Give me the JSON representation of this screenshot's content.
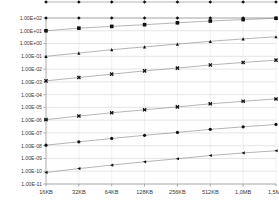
{
  "chart_data": {
    "type": "line",
    "title": "",
    "subtitle": "",
    "xlabel": "",
    "ylabel": "",
    "yscale": "log",
    "xscale": "category",
    "grid": true,
    "legend_position": "none",
    "categories": [
      "16KB",
      "32KB",
      "64KB",
      "128KB",
      "256KB",
      "512KB",
      "1,0MB",
      "1,5MB"
    ],
    "ytick_labels": [
      "1.00E+02",
      "1.00E+01",
      "1.00E+00",
      "1.00E-01",
      "1.00E-02",
      "1.00E-03",
      "1.00E-04",
      "1.00E-05",
      "1.00E-06",
      "1.00E-07",
      "1.00E-08",
      "1.00E-09",
      "1.00E-10",
      "1.00E-11"
    ],
    "ytick_values": [
      100,
      10,
      1,
      0.1,
      0.01,
      0.001,
      0.0001,
      1e-05,
      1e-06,
      1e-07,
      1e-08,
      1e-09,
      1e-10,
      1e-11
    ],
    "ylim": [
      1e-11,
      100.0
    ],
    "series": [
      {
        "name": "series-clipped-top",
        "marker": "diamond",
        "clipped": true,
        "values": [
          600,
          600,
          600,
          600,
          600,
          600,
          600,
          600
        ]
      },
      {
        "name": "series-diamond",
        "marker": "diamond",
        "clipped": false,
        "values": [
          100,
          100,
          100,
          100,
          100,
          100,
          100,
          100
        ]
      },
      {
        "name": "series-square",
        "marker": "square",
        "clipped": false,
        "values": [
          10,
          16,
          22,
          30,
          42,
          58,
          75,
          95
        ]
      },
      {
        "name": "series-triangle",
        "marker": "triangle",
        "clipped": false,
        "values": [
          0.1,
          0.18,
          0.33,
          0.55,
          0.9,
          1.5,
          2.3,
          3.4
        ]
      },
      {
        "name": "series-cross",
        "marker": "cross",
        "clipped": false,
        "values": [
          0.0012,
          0.0022,
          0.004,
          0.0072,
          0.012,
          0.021,
          0.033,
          0.05
        ]
      },
      {
        "name": "series-asterisk",
        "marker": "asterisk",
        "clipped": false,
        "values": [
          1.1e-06,
          2.1e-06,
          3.8e-06,
          6.5e-06,
          1.1e-05,
          1.9e-05,
          3e-05,
          4.6e-05
        ]
      },
      {
        "name": "series-circle",
        "marker": "circle",
        "clipped": false,
        "values": [
          1.1e-08,
          2e-08,
          3.7e-08,
          6.5e-08,
          1.1e-07,
          1.9e-07,
          3e-07,
          4.6e-07
        ]
      },
      {
        "name": "series-left-triangle",
        "marker": "left-triangle",
        "clipped": false,
        "values": [
          8e-11,
          1.6e-10,
          3e-10,
          5.5e-10,
          9.5e-10,
          1.7e-09,
          2.7e-09,
          4e-09
        ]
      }
    ],
    "colors": {
      "background": "#ffffff",
      "gridline": "#d4d4d4",
      "series_line": "#8d8d8d",
      "marker": "#111111",
      "tick_text": "#3a3a3a"
    }
  }
}
